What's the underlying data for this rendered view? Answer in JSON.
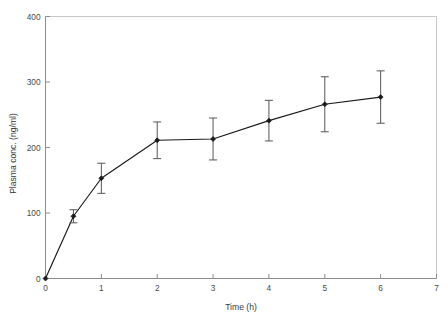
{
  "chart_data": {
    "type": "line",
    "title": "",
    "subtitle": "",
    "xlabel": "Time (h)",
    "ylabel": "Plasma conc. (ng/ml)",
    "xlim": [
      0,
      7
    ],
    "ylim": [
      0,
      400
    ],
    "xticks": [
      0,
      1,
      2,
      3,
      4,
      5,
      6,
      7
    ],
    "xtick_labels": [
      "0",
      "1",
      "2",
      "3",
      "4",
      "5",
      "6",
      "7"
    ],
    "yticks": [
      0,
      100,
      200,
      300,
      400
    ],
    "ytick_labels": [
      "0",
      "100",
      "200",
      "300",
      "400"
    ],
    "grid": false,
    "legend": null,
    "legend_position": "none",
    "marker": "filled-diamond",
    "line_color": "#1a1a1a",
    "errorbar_color": "#555555",
    "frame": true,
    "x": [
      0,
      0.5,
      1,
      2,
      3,
      4,
      5,
      6
    ],
    "values": [
      0,
      95,
      153,
      211,
      213,
      241,
      266,
      277
    ],
    "yerr": [
      0,
      10,
      23,
      28,
      32,
      31,
      42,
      40
    ],
    "series": [
      {
        "name": "Plasma concentration",
        "points": [
          {
            "x": 0,
            "y": 0,
            "err": 0
          },
          {
            "x": 0.5,
            "y": 95,
            "err": 10
          },
          {
            "x": 1,
            "y": 153,
            "err": 23
          },
          {
            "x": 2,
            "y": 211,
            "err": 28
          },
          {
            "x": 3,
            "y": 213,
            "err": 32
          },
          {
            "x": 4,
            "y": 241,
            "err": 31
          },
          {
            "x": 5,
            "y": 266,
            "err": 42
          },
          {
            "x": 6,
            "y": 277,
            "err": 40
          }
        ]
      }
    ]
  },
  "axes": {
    "x_title": "Time (h)",
    "y_title": "Plasma conc. (ng/ml)",
    "xtick_labels": [
      "0",
      "1",
      "2",
      "3",
      "4",
      "5",
      "6",
      "7"
    ],
    "ytick_labels": [
      "0",
      "100",
      "200",
      "300",
      "400"
    ]
  }
}
